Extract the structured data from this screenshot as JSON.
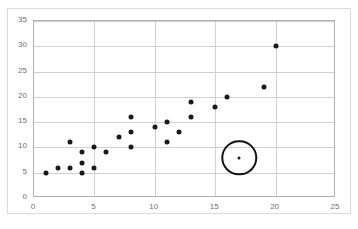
{
  "chart_data": {
    "type": "scatter",
    "title": "",
    "xlabel": "",
    "ylabel": "",
    "xlim": [
      0,
      25
    ],
    "ylim": [
      0,
      35
    ],
    "x_ticks": [
      0,
      5,
      10,
      15,
      20,
      25
    ],
    "y_ticks": [
      0,
      5,
      10,
      15,
      20,
      25,
      30,
      35
    ],
    "grid": true,
    "legend": "none",
    "series": [
      {
        "name": "data",
        "marker": "filled-circle",
        "color": "#1a1a1a",
        "points": [
          [
            1,
            5
          ],
          [
            2,
            6
          ],
          [
            3,
            6
          ],
          [
            3,
            11
          ],
          [
            4,
            5
          ],
          [
            4,
            7
          ],
          [
            4,
            9
          ],
          [
            5,
            6
          ],
          [
            5,
            10
          ],
          [
            6,
            9
          ],
          [
            7,
            12
          ],
          [
            8,
            10
          ],
          [
            8,
            13
          ],
          [
            8,
            16
          ],
          [
            10,
            14
          ],
          [
            11,
            11
          ],
          [
            11,
            15
          ],
          [
            12,
            13
          ],
          [
            13,
            16
          ],
          [
            13,
            19
          ],
          [
            15,
            18
          ],
          [
            16,
            20
          ],
          [
            17,
            8
          ],
          [
            19,
            22
          ],
          [
            20,
            30
          ]
        ]
      }
    ],
    "annotations": [
      {
        "type": "circle-highlight",
        "name": "outlier-highlight",
        "center": [
          17,
          8
        ],
        "radius_x_units": 1.3,
        "color": "#111111",
        "label": ""
      }
    ]
  },
  "axes": {
    "y_tick_labels": [
      "0",
      "5",
      "10",
      "15",
      "20",
      "25",
      "30",
      "35"
    ],
    "x_tick_labels": [
      "0",
      "5",
      "10",
      "15",
      "20",
      "25"
    ]
  },
  "style": {
    "plot_border_color": "#b0b0b0",
    "gridline_color": "#d0d0d0",
    "tick_label_color": "#6f6f6f",
    "marker_color": "#1a1a1a",
    "background": "#ffffff",
    "outer_frame_color": "#d9d9d9"
  }
}
